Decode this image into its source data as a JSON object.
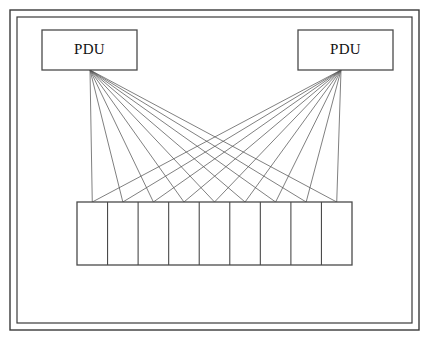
{
  "diagram": {
    "background_color": "#ffffff",
    "line_color": "#4a4a4a",
    "cable_color": "#555555",
    "frame": {
      "outer": {
        "x": 10,
        "y": 10,
        "width": 409,
        "height": 320
      },
      "inner": {
        "x": 17,
        "y": 17,
        "width": 395,
        "height": 306
      }
    },
    "pdus": [
      {
        "id": "pdu-left",
        "label": "PDU",
        "x": 42,
        "y": 30,
        "width": 95,
        "height": 40,
        "feed_x": 90,
        "feed_y": 70
      },
      {
        "id": "pdu-right",
        "label": "PDU",
        "x": 298,
        "y": 30,
        "width": 95,
        "height": 40,
        "feed_x": 341,
        "feed_y": 70
      }
    ],
    "rack": {
      "id": "equipment-rack",
      "x": 77,
      "y": 202,
      "width": 275,
      "height": 63,
      "cell_count": 9
    },
    "cables": {
      "connection_points": 9,
      "per_pdu": 9,
      "total": 18
    }
  }
}
